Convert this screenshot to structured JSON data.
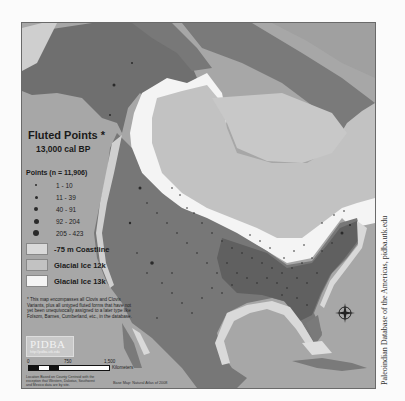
{
  "map": {
    "title": "Fluted Points *",
    "subtitle": "13,000 cal BP",
    "colors": {
      "ocean": "#a7a7a7",
      "land": "#7b7b7b",
      "land_dark": "#5e5e5e",
      "glacial_ice_12k": "#c2c2c2",
      "glacial_ice_13k": "#f4f4f4",
      "coastline_75m": "#d9d9d9",
      "points": "#2a2a2a"
    }
  },
  "legend": {
    "points_title": "Points (n = 11,906)",
    "point_classes": [
      {
        "label": "1 - 10",
        "size": 2
      },
      {
        "label": "11 - 39",
        "size": 3
      },
      {
        "label": "40 - 91",
        "size": 4
      },
      {
        "label": "92 - 204",
        "size": 5
      },
      {
        "label": "205 - 423",
        "size": 6
      }
    ],
    "areas": [
      {
        "label": "-75 m Coastline",
        "color": "#d9d9d9"
      },
      {
        "label": "Glacial Ice 12k",
        "color": "#c2c2c2"
      },
      {
        "label": "Glacial Ice 13k",
        "color": "#f4f4f4"
      }
    ],
    "note": "* This map encompasses all Clovis and Clovis Variants, plus all untyped fluted forms that have not yet been unequivocally assigned to a later type like Folsom, Barnes, Cumberland, etc., in the database."
  },
  "logo": {
    "text": "PIDBA",
    "url": "http://pidba.utk.edu"
  },
  "scale_bar": {
    "ticks": [
      "0",
      "750",
      "1,500"
    ],
    "unit": "Kilometers"
  },
  "credits": {
    "left": "Location Based on County Centroid with the exception that Western, Dakotas, Southwest and Mexico data are by site.",
    "basemap": "Base Map: Natural Atlas of 2008"
  },
  "side_credit": "Paleoindian Database of the Americas, pidba.utk.edu"
}
